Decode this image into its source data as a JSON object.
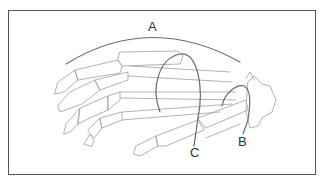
{
  "figure": {
    "labels": {
      "a": "A",
      "b": "B",
      "c": "C"
    },
    "colors": {
      "frame": "#555555",
      "bones": "#a9a9a9",
      "arches": "#6a6a6a",
      "label_text": "#333333"
    }
  }
}
